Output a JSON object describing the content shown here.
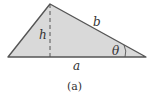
{
  "figure": {
    "caption": "(a)",
    "shape": "triangle",
    "fill_color": "#d9d9d9",
    "stroke_color": "#555555",
    "labels": {
      "height": "h",
      "side_b": "b",
      "angle": "θ",
      "base": "a"
    }
  }
}
